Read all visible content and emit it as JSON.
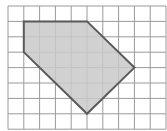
{
  "diagram": {
    "type": "grid-polygon",
    "grid": {
      "columns": 10,
      "rows": 8,
      "origin_px": [
        8,
        6
      ],
      "cell_w": 15.8,
      "cell_h": 15.4,
      "line_color": "#9a9a9a"
    },
    "polygon": {
      "vertices_grid": [
        [
          1,
          1
        ],
        [
          5,
          1
        ],
        [
          8,
          4
        ],
        [
          5,
          7
        ],
        [
          1,
          3
        ]
      ],
      "fill": "#c9c9c9",
      "stroke": "#5a5a5a",
      "stroke_width": 2
    }
  }
}
